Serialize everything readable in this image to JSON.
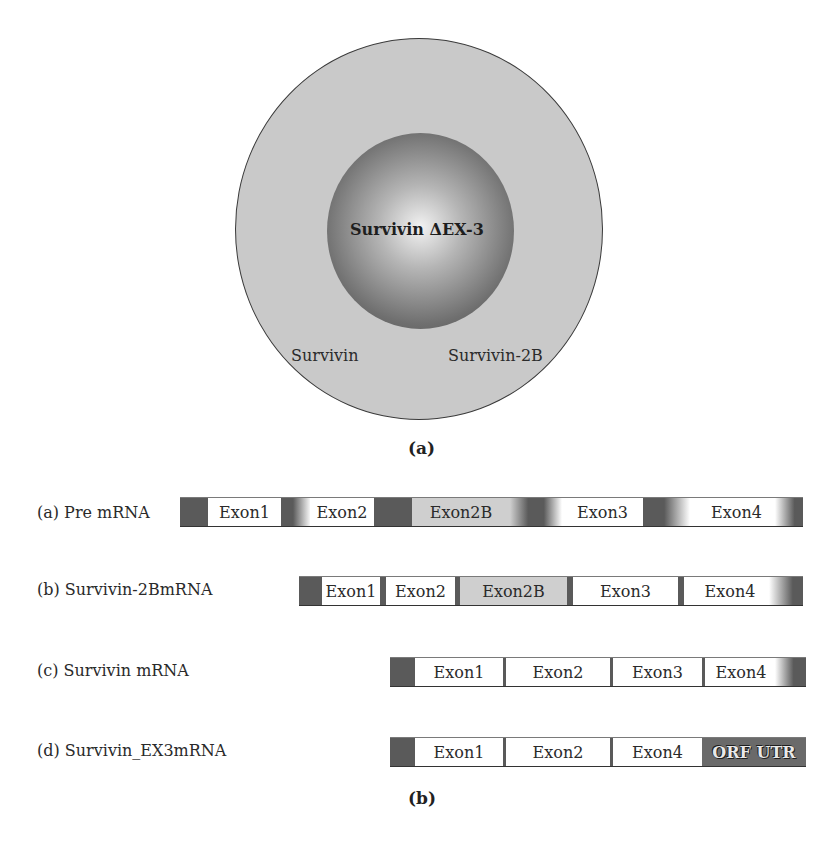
{
  "panel_a": {
    "label": "(a)",
    "center_label": "Survivin ΔEX-3",
    "outer_labels": [
      "Survivin",
      "Survivin-2B"
    ]
  },
  "panel_b": {
    "label": "(b)",
    "rows": [
      {
        "label": "(a) Pre mRNA",
        "segments": [
          "Exon1",
          "Exon2",
          "Exon2B",
          "Exon3",
          "Exon4"
        ]
      },
      {
        "label": "(b) Survivin-2BmRNA",
        "segments": [
          "Exon1",
          "Exon2",
          "Exon2B",
          "Exon3",
          "Exon4"
        ]
      },
      {
        "label": "(c) Survivin mRNA",
        "segments": [
          "Exon1",
          "Exon2",
          "Exon3",
          "Exon4"
        ]
      },
      {
        "label": "(d) Survivin_EX3mRNA",
        "segments": [
          "Exon1",
          "Exon2",
          "Exon4",
          "ORF UTR"
        ]
      }
    ]
  },
  "colors": {
    "outer_circle": "#c9c9c9",
    "intron": "#5a5a5a",
    "exon": "#ffffff",
    "exon2b": "#cfcfcf"
  }
}
